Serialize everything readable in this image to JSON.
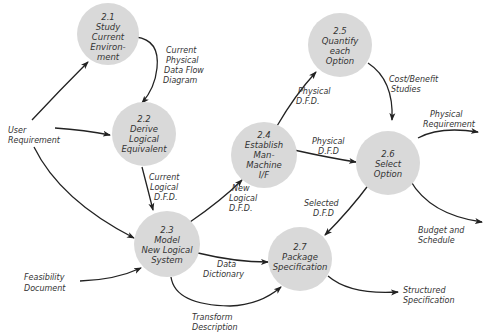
{
  "diagram": {
    "type": "data-flow-diagram",
    "colors": {
      "bubble": "#d9d9d9",
      "line": "#222222",
      "text": "#333333"
    },
    "nodes": [
      {
        "id": "2.1",
        "lines": [
          "2.1",
          "Study",
          "Current",
          "Environ-",
          "ment"
        ]
      },
      {
        "id": "2.2",
        "lines": [
          "2.2",
          "Derive",
          "Logical",
          "Equivalent"
        ]
      },
      {
        "id": "2.3",
        "lines": [
          "2.3",
          "Model",
          "New Logical",
          "System"
        ]
      },
      {
        "id": "2.4",
        "lines": [
          "2.4",
          "Establish",
          "Man-",
          "Machine",
          "I/F"
        ]
      },
      {
        "id": "2.5",
        "lines": [
          "2.5",
          "Quantify",
          "each",
          "Option"
        ]
      },
      {
        "id": "2.6",
        "lines": [
          "2.6",
          "Select",
          "Option"
        ]
      },
      {
        "id": "2.7",
        "lines": [
          "2.7",
          "Package",
          "Specification"
        ]
      }
    ],
    "flows": [
      {
        "from": "User Requirement",
        "to": "2.1",
        "lines": []
      },
      {
        "from": "User Requirement",
        "to": "2.2",
        "lines": []
      },
      {
        "from": "User Requirement",
        "to": "2.3",
        "lines": []
      },
      {
        "from": "2.1",
        "to": "2.2",
        "lines": [
          "Current",
          "Physical",
          "Data Flow",
          "Diagram"
        ]
      },
      {
        "from": "2.2",
        "to": "2.3",
        "lines": [
          "Current",
          "Logical",
          "D.F.D."
        ]
      },
      {
        "from": "2.3",
        "to": "2.4",
        "lines": [
          "New",
          "Logical",
          "D.F.D."
        ]
      },
      {
        "from": "2.4",
        "to": "2.5",
        "lines": [
          "Physical",
          "D.F.D."
        ]
      },
      {
        "from": "2.4",
        "to": "2.6",
        "lines": [
          "Physical",
          "D.F.D"
        ]
      },
      {
        "from": "2.5",
        "to": "2.6",
        "lines": [
          "Cost/Benefit",
          "Studies"
        ]
      },
      {
        "from": "2.6",
        "to": "2.7",
        "lines": [
          "Selected",
          "D.F.D"
        ]
      },
      {
        "from": "2.6",
        "to": "out",
        "lines": [
          "Physical",
          "Requirement"
        ]
      },
      {
        "from": "2.6",
        "to": "out",
        "lines": [
          "Budget and",
          "Schedule"
        ]
      },
      {
        "from": "Feasibility Document",
        "to": "2.3",
        "lines": []
      },
      {
        "from": "2.3",
        "to": "2.7",
        "lines": [
          "Data",
          "Dictionary"
        ]
      },
      {
        "from": "2.3",
        "to": "2.7",
        "lines": [
          "Transform",
          "Description"
        ]
      },
      {
        "from": "2.7",
        "to": "out",
        "lines": [
          "Structured",
          "Specification"
        ]
      }
    ],
    "externals": [
      {
        "id": "user-requirement",
        "lines": [
          "User",
          "Requirement"
        ]
      },
      {
        "id": "feasibility-document",
        "lines": [
          "Feasibility",
          "Document"
        ]
      }
    ]
  }
}
